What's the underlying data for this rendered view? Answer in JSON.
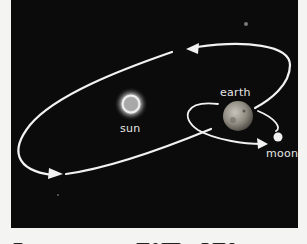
{
  "diagram": {
    "labels": {
      "sun": "sun",
      "earth": "earth",
      "moon": "moon"
    },
    "colors": {
      "background": "#0b0b0b",
      "orbit": "#f2f2f2",
      "sun_glow": "#e8e8e8",
      "earth": "#9a958c",
      "moon": "#f0f0f0"
    },
    "caption_clipped": true
  }
}
